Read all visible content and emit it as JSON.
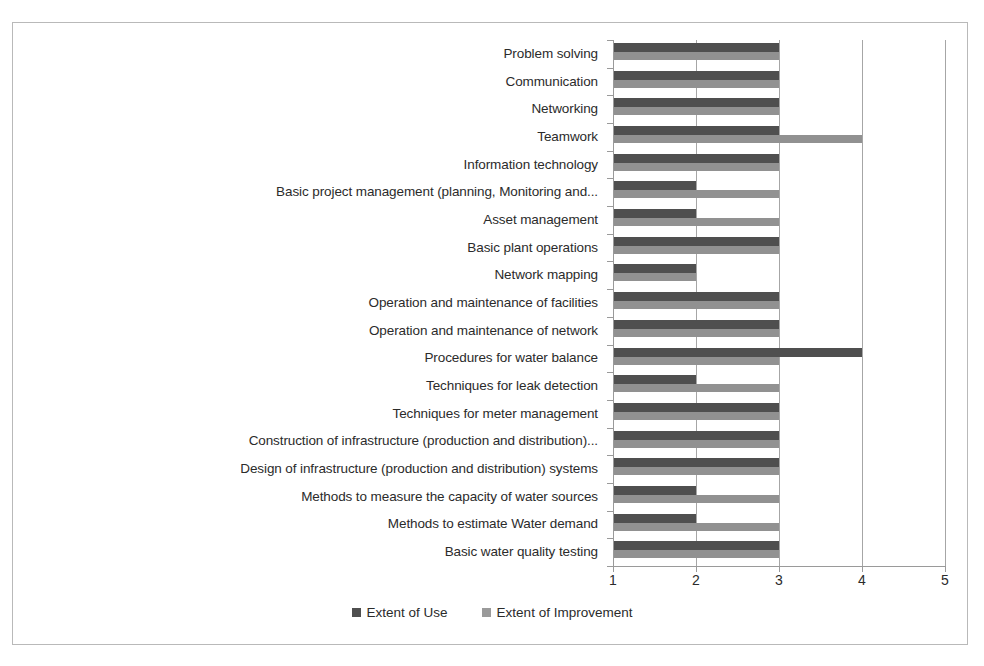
{
  "chart_data": {
    "type": "bar",
    "orientation": "horizontal",
    "title": "",
    "subtitle": "",
    "xlabel": "",
    "ylabel": "",
    "xlim": [
      1,
      5
    ],
    "xticks": [
      "1",
      "2",
      "3",
      "4",
      "5"
    ],
    "grid": true,
    "legend_position": "bottom",
    "categories": [
      "Problem solving",
      "Communication",
      "Networking",
      "Teamwork",
      "Information technology",
      "Basic project management (planning, Monitoring and...",
      "Asset management",
      "Basic plant operations",
      "Network mapping",
      "Operation and maintenance of facilities",
      "Operation and maintenance of network",
      "Procedures for water balance",
      "Techniques  for leak detection",
      "Techniques for meter management",
      "Construction of infrastructure (production and distribution)...",
      "Design of infrastructure (production and distribution) systems",
      "Methods to measure the capacity of water sources",
      "Methods to estimate Water demand",
      "Basic water quality testing"
    ],
    "series": [
      {
        "name": "Extent of Use",
        "color": "#4f4f4f",
        "values": [
          3,
          3,
          3,
          3,
          3,
          2,
          2,
          3,
          2,
          3,
          3,
          4,
          2,
          3,
          3,
          3,
          2,
          2,
          3
        ]
      },
      {
        "name": "Extent of Improvement",
        "color": "#919191",
        "values": [
          3,
          3,
          3,
          4,
          3,
          3,
          3,
          3,
          2,
          3,
          3,
          3,
          3,
          3,
          3,
          3,
          3,
          3,
          3
        ]
      }
    ]
  },
  "legend": {
    "items": [
      {
        "label": "Extent of Use"
      },
      {
        "label": "Extent of Improvement"
      }
    ]
  }
}
